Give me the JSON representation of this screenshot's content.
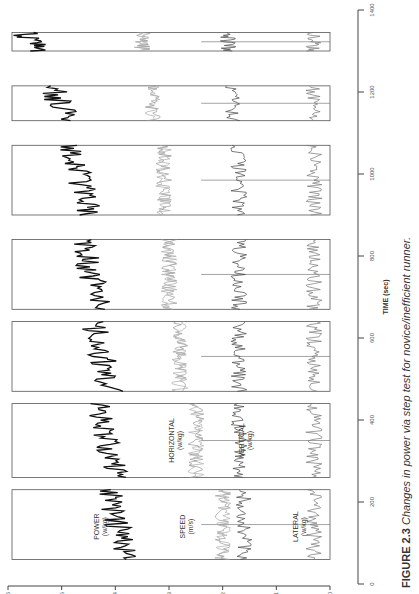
{
  "chart_data": {
    "type": "line",
    "title": "",
    "xlabel": "TIME (sec)",
    "ylabel": "",
    "xlim": [
      0,
      1400
    ],
    "ylim": [
      0,
      6
    ],
    "x_ticks": [
      "0",
      "200",
      "400",
      "600",
      "800",
      "1000",
      "1200",
      "1400"
    ],
    "y_ticks": [
      "0",
      "1",
      "2",
      "3",
      "4",
      "5",
      "6"
    ],
    "stages": [
      {
        "start": 60,
        "end": 230
      },
      {
        "start": 260,
        "end": 440
      },
      {
        "start": 470,
        "end": 640
      },
      {
        "start": 670,
        "end": 840
      },
      {
        "start": 900,
        "end": 1070
      },
      {
        "start": 1130,
        "end": 1215
      },
      {
        "start": 1300,
        "end": 1345
      }
    ],
    "series": [
      {
        "name": "POWER (w/kg)",
        "approx_level": [
          3.8,
          4.0,
          4.1,
          4.3,
          4.5,
          4.9,
          5.4
        ]
      },
      {
        "name": "SPEED (m/s)",
        "approx_level": [
          2.0,
          2.5,
          2.8,
          3.0,
          3.1,
          3.3,
          3.5
        ]
      },
      {
        "name": "HORIZONTAL (w/kg)",
        "approx_level": [
          2.0,
          2.5,
          2.8,
          3.0,
          3.1,
          3.3,
          3.5
        ]
      },
      {
        "name": "VERTICAL (w/kg)",
        "approx_level": [
          1.6,
          1.7,
          1.7,
          1.7,
          1.7,
          1.8,
          1.9
        ]
      },
      {
        "name": "LATERAL (w/kg)",
        "approx_level": [
          0.3,
          0.3,
          0.3,
          0.3,
          0.3,
          0.3,
          0.3
        ]
      }
    ]
  },
  "labels": {
    "power": "POWER",
    "power_unit": "(w/kg)",
    "speed": "SPEED",
    "speed_unit": "(m/s)",
    "horizontal": "HORIZONTAL",
    "horizontal_unit": "(w/kg)",
    "vertical": "VERTICAL",
    "vertical_unit": "(w/kg)",
    "lateral": "LATERAL",
    "lateral_unit": "(w/kg)",
    "xaxis": "TIME (sec)"
  },
  "caption": {
    "prefix": "FIGURE 2.3",
    "text": " Changes in power via step test for novice/inefficient runner."
  }
}
